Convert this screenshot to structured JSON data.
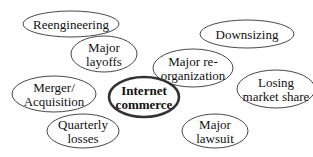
{
  "diagram": {
    "center": {
      "id": "internet-commerce",
      "lines": [
        "Internet",
        "commerce"
      ],
      "cx": 144,
      "cy": 97,
      "rx": 35,
      "ry": 20
    },
    "nodes": [
      {
        "id": "reengineering",
        "lines": [
          "Reengineering"
        ],
        "cx": 71,
        "cy": 24,
        "rx": 48,
        "ry": 13
      },
      {
        "id": "major-layoffs",
        "lines": [
          "Major",
          "layoffs"
        ],
        "cx": 104,
        "cy": 54,
        "rx": 33,
        "ry": 18
      },
      {
        "id": "downsizing",
        "lines": [
          "Downsizing"
        ],
        "cx": 247,
        "cy": 34,
        "rx": 47,
        "ry": 14
      },
      {
        "id": "major-reorganization",
        "lines": [
          "Major re-",
          "organization"
        ],
        "cx": 193,
        "cy": 68,
        "rx": 40,
        "ry": 19
      },
      {
        "id": "merger-acquisition",
        "lines": [
          "Merger/",
          "Acquisition"
        ],
        "cx": 54,
        "cy": 94,
        "rx": 42,
        "ry": 18
      },
      {
        "id": "losing-market-share",
        "lines": [
          "Losing",
          "market share"
        ],
        "cx": 276,
        "cy": 89,
        "rx": 39,
        "ry": 19
      },
      {
        "id": "quarterly-losses",
        "lines": [
          "Quarterly",
          "losses"
        ],
        "cx": 83,
        "cy": 131,
        "rx": 36,
        "ry": 17
      },
      {
        "id": "major-lawsuit",
        "lines": [
          "Major",
          "lawsuit"
        ],
        "cx": 215,
        "cy": 131,
        "rx": 33,
        "ry": 17
      }
    ]
  }
}
